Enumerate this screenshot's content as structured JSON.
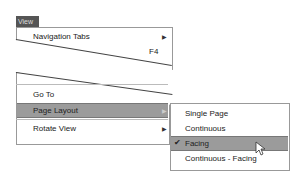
{
  "menubar": {
    "view_label": "View"
  },
  "menu": {
    "items": [
      {
        "label": "Navigation Tabs",
        "has_submenu": true
      },
      {
        "label": "",
        "shortcut": "F4"
      },
      {
        "label": "Go To"
      },
      {
        "label": "Page Layout",
        "has_submenu": true,
        "highlighted": true
      },
      {
        "label": "Rotate View",
        "has_submenu": true
      }
    ]
  },
  "submenu": {
    "items": [
      {
        "label": "Single Page"
      },
      {
        "label": "Continuous"
      },
      {
        "label": "Facing",
        "checked": true,
        "highlighted": true
      },
      {
        "label": "Continuous - Facing"
      }
    ]
  },
  "colors": {
    "highlight": "#9b9b9b",
    "tab": "#555555"
  }
}
